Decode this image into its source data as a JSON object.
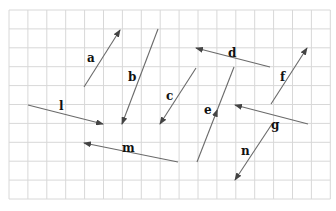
{
  "grid": {
    "x0": 9,
    "y0": 10,
    "cols": 17,
    "rows": 10,
    "cell": 18.9,
    "line_color": "#d8d8d8"
  },
  "colors": {
    "vector": "#6a6a6a",
    "arrowhead": "#444444",
    "label": "#111111"
  },
  "vectors": [
    {
      "name": "a",
      "from": [
        84,
        87
      ],
      "to": [
        120,
        30
      ],
      "label_pos": [
        87,
        62
      ]
    },
    {
      "name": "b",
      "from": [
        158,
        29
      ],
      "to": [
        122,
        124
      ],
      "label_pos": [
        128,
        81
      ]
    },
    {
      "name": "c",
      "from": [
        196,
        68
      ],
      "to": [
        160,
        124
      ],
      "label_pos": [
        166,
        100
      ]
    },
    {
      "name": "d",
      "from": [
        270,
        67
      ],
      "to": [
        196,
        48
      ],
      "label_pos": [
        228,
        57
      ]
    },
    {
      "name": "e",
      "from": [
        197,
        162
      ],
      "to": [
        234,
        67
      ],
      "label_pos": [
        204,
        114
      ],
      "arrow_mid": true
    },
    {
      "name": "f",
      "from": [
        271,
        104
      ],
      "to": [
        307,
        48
      ],
      "label_pos": [
        280,
        81
      ]
    },
    {
      "name": "g",
      "from": [
        308,
        124
      ],
      "to": [
        235,
        105
      ],
      "label_pos": [
        271,
        129
      ]
    },
    {
      "name": "n",
      "from": [
        272,
        124
      ],
      "to": [
        235,
        180
      ],
      "label_pos": [
        241,
        155
      ]
    },
    {
      "name": "m",
      "from": [
        178,
        162
      ],
      "to": [
        84,
        143
      ],
      "label_pos": [
        122,
        152
      ]
    },
    {
      "name": "l",
      "from": [
        28,
        105
      ],
      "to": [
        103,
        124
      ],
      "label_pos": [
        59,
        110
      ]
    }
  ]
}
